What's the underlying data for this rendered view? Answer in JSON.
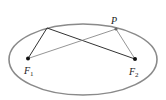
{
  "diagram": {
    "title": "",
    "ellipse": {
      "cx": 83,
      "cy": 59.5,
      "rx": 74,
      "ry": 35.5,
      "stroke": "#8a8a8a",
      "stroke_width": 1.6
    },
    "points": {
      "F1": {
        "x": 28,
        "y": 58.5,
        "label": "F",
        "subscript": "1"
      },
      "F2": {
        "x": 135,
        "y": 59,
        "label": "F",
        "subscript": "2"
      },
      "P": {
        "x": 116,
        "y": 29,
        "label": "P"
      },
      "Q": {
        "x": 47,
        "y": 28
      }
    },
    "segments": [
      {
        "from": "F1",
        "to": "Q",
        "color": "#333333"
      },
      {
        "from": "Q",
        "to": "F2",
        "color": "#333333"
      },
      {
        "from": "F1",
        "to": "P",
        "color": "#7a7a7a"
      },
      {
        "from": "P",
        "to": "F2",
        "color": "#7a7a7a"
      }
    ],
    "colors": {
      "dark_line": "#333333",
      "light_line": "#7a7a7a",
      "ellipse": "#8a8a8a",
      "dot": "#111111",
      "p_dot": "#6a6a6a"
    }
  }
}
